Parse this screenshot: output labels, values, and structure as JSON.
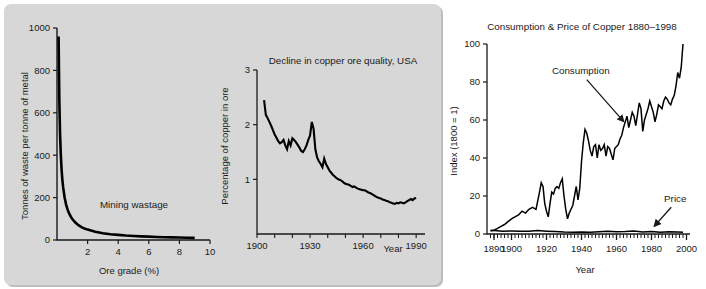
{
  "figure": {
    "panel_background": "#d7d7d7",
    "page_background": "#ffffff",
    "ink_color": "#1a1a1a"
  },
  "chart_data": [
    {
      "id": "mining-wastage",
      "type": "line",
      "title": "Mining wastage",
      "title_position": "inside-plot",
      "xlabel": "Ore grade (%)",
      "ylabel": "Tonnes of waste per tonne of metal",
      "xlim": [
        0,
        10
      ],
      "ylim": [
        0,
        1000
      ],
      "xticks": [
        0,
        2,
        4,
        6,
        8,
        10
      ],
      "xticklabels": [
        "0",
        "2",
        "4",
        "6",
        "8",
        "10"
      ],
      "yticks": [
        0,
        200,
        400,
        600,
        800,
        1000
      ],
      "yticklabels": [
        "0",
        "200",
        "400",
        "600",
        "800",
        "1000"
      ],
      "grid": false,
      "legend": "none",
      "series": [
        {
          "name": "waste per tonne of metal",
          "note": "hyperbolic: waste = 100/grade - 1",
          "x": [
            0.104,
            0.15,
            0.2,
            0.25,
            0.3,
            0.35,
            0.4,
            0.5,
            0.6,
            0.7,
            0.8,
            0.9,
            1.0,
            1.2,
            1.4,
            1.6,
            1.8,
            2.0,
            2.5,
            3.0,
            3.5,
            4.0,
            4.5,
            5.0,
            5.5,
            6.0,
            6.5,
            7.0,
            7.5,
            8.0,
            8.5,
            9.0
          ],
          "y": [
            960,
            666,
            499,
            399,
            332,
            285,
            249,
            199,
            166,
            142,
            124,
            110,
            99,
            82,
            70,
            61,
            54,
            49,
            39,
            32,
            27,
            24,
            21,
            19,
            17,
            15.7,
            14.4,
            13.3,
            12.3,
            11.5,
            10.8,
            10.1
          ]
        }
      ]
    },
    {
      "id": "copper-ore-quality",
      "type": "line",
      "title": "Decline in copper ore quality, USA",
      "title_position": "inside-plot-top-right",
      "xlabel": "Year",
      "ylabel": "Percentage of copper in ore",
      "xlim": [
        1900,
        1995
      ],
      "ylim": [
        0,
        3
      ],
      "xticks": [
        1900,
        1910,
        1920,
        1930,
        1940,
        1950,
        1960,
        1970,
        1980,
        1990
      ],
      "xticklabels": [
        "1900",
        "",
        "",
        "1930",
        "",
        "",
        "1960",
        "",
        "",
        "1990"
      ],
      "yticks": [
        0,
        1,
        2,
        3
      ],
      "yticklabels": [
        "",
        "1",
        "2",
        "3"
      ],
      "grid": false,
      "legend": "none",
      "series": [
        {
          "name": "Percentage of copper in ore",
          "x": [
            1904,
            1905,
            1906,
            1907,
            1908,
            1909,
            1910,
            1911,
            1912,
            1913,
            1914,
            1915,
            1916,
            1917,
            1918,
            1919,
            1920,
            1921,
            1922,
            1923,
            1924,
            1925,
            1926,
            1927,
            1928,
            1929,
            1930,
            1931,
            1932,
            1933,
            1934,
            1935,
            1936,
            1937,
            1938,
            1939,
            1940,
            1941,
            1942,
            1943,
            1944,
            1945,
            1946,
            1947,
            1948,
            1949,
            1950,
            1951,
            1952,
            1953,
            1954,
            1955,
            1956,
            1957,
            1958,
            1959,
            1960,
            1961,
            1962,
            1963,
            1964,
            1965,
            1966,
            1967,
            1968,
            1969,
            1970,
            1971,
            1972,
            1973,
            1974,
            1975,
            1976,
            1977,
            1978,
            1979,
            1980,
            1981,
            1982,
            1983,
            1984,
            1985,
            1986,
            1987,
            1988,
            1989,
            1990
          ],
          "y": [
            2.45,
            2.18,
            2.12,
            2.05,
            1.98,
            1.9,
            1.82,
            1.76,
            1.7,
            1.66,
            1.68,
            1.72,
            1.62,
            1.55,
            1.7,
            1.62,
            1.75,
            1.72,
            1.68,
            1.63,
            1.58,
            1.52,
            1.5,
            1.55,
            1.62,
            1.72,
            1.8,
            2.05,
            1.92,
            1.55,
            1.4,
            1.33,
            1.28,
            1.22,
            1.38,
            1.28,
            1.22,
            1.16,
            1.12,
            1.08,
            1.05,
            1.02,
            1.0,
            0.99,
            0.97,
            0.94,
            0.92,
            0.91,
            0.9,
            0.88,
            0.86,
            0.87,
            0.85,
            0.83,
            0.82,
            0.81,
            0.8,
            0.8,
            0.78,
            0.76,
            0.75,
            0.73,
            0.71,
            0.69,
            0.67,
            0.66,
            0.65,
            0.63,
            0.62,
            0.61,
            0.6,
            0.58,
            0.57,
            0.56,
            0.55,
            0.57,
            0.56,
            0.58,
            0.57,
            0.56,
            0.58,
            0.6,
            0.62,
            0.64,
            0.62,
            0.65,
            0.66
          ]
        }
      ]
    },
    {
      "id": "consumption-price-copper",
      "type": "line",
      "title": "Consumption & Price of Copper 1880–1998",
      "title_position": "above-plot",
      "xlabel": "Year",
      "ylabel": "Index (1800 = 1)",
      "xlim": [
        1886,
        2002
      ],
      "ylim": [
        0,
        100
      ],
      "xticks": [
        1890,
        1900,
        1920,
        1940,
        1960,
        1980,
        2000
      ],
      "xticklabels": [
        "1890",
        "1900",
        "1920",
        "1940",
        "1960",
        "1980",
        "2000"
      ],
      "yticks": [
        0,
        20,
        40,
        60,
        80,
        100
      ],
      "yticklabels": [
        "0",
        "20",
        "40",
        "60",
        "80",
        "100"
      ],
      "grid": false,
      "legend": "annotations",
      "annotations": [
        {
          "label": "Consumption",
          "target_x": 1967,
          "target_y": 56
        },
        {
          "label": "Price",
          "target_x": 1981,
          "target_y": 2
        }
      ],
      "series": [
        {
          "name": "Consumption",
          "x": [
            1888,
            1890,
            1892,
            1894,
            1896,
            1898,
            1900,
            1902,
            1904,
            1906,
            1908,
            1910,
            1912,
            1914,
            1916,
            1917,
            1918,
            1919,
            1920,
            1921,
            1922,
            1923,
            1924,
            1925,
            1926,
            1927,
            1928,
            1929,
            1930,
            1931,
            1932,
            1933,
            1934,
            1935,
            1936,
            1937,
            1938,
            1939,
            1940,
            1941,
            1942,
            1943,
            1944,
            1945,
            1946,
            1947,
            1948,
            1949,
            1950,
            1951,
            1952,
            1953,
            1954,
            1955,
            1956,
            1957,
            1958,
            1959,
            1960,
            1961,
            1962,
            1963,
            1964,
            1965,
            1966,
            1967,
            1968,
            1969,
            1970,
            1971,
            1972,
            1973,
            1974,
            1975,
            1976,
            1977,
            1978,
            1979,
            1980,
            1981,
            1982,
            1983,
            1984,
            1985,
            1986,
            1987,
            1988,
            1989,
            1990,
            1991,
            1992,
            1993,
            1994,
            1995,
            1996,
            1997,
            1998
          ],
          "y": [
            1.5,
            2,
            3,
            4,
            5,
            6.5,
            8,
            9,
            10,
            12,
            11,
            13,
            14,
            13,
            22,
            27,
            25,
            16,
            12,
            9,
            16,
            22,
            21,
            24,
            25,
            24,
            27,
            29,
            20,
            13,
            8,
            11,
            13,
            15,
            20,
            25,
            18,
            24,
            38,
            48,
            55,
            53,
            49,
            44,
            41,
            46,
            47,
            40,
            47,
            44,
            45,
            47,
            41,
            46,
            45,
            42,
            39,
            45,
            46,
            47,
            50,
            52,
            56,
            59,
            62,
            56,
            60,
            64,
            62,
            57,
            63,
            69,
            66,
            54,
            60,
            63,
            66,
            70,
            67,
            64,
            59,
            63,
            68,
            67,
            66,
            70,
            72,
            71,
            69,
            68,
            71,
            73,
            78,
            85,
            82,
            88,
            100
          ]
        },
        {
          "name": "Price",
          "x": [
            1888,
            1890,
            1895,
            1900,
            1905,
            1910,
            1915,
            1920,
            1925,
            1930,
            1935,
            1940,
            1945,
            1950,
            1955,
            1960,
            1965,
            1970,
            1975,
            1980,
            1985,
            1990,
            1995,
            1998
          ],
          "y": [
            2.0,
            1.8,
            1.5,
            1.6,
            1.5,
            1.4,
            1.8,
            1.5,
            1.3,
            1.0,
            0.9,
            1.0,
            0.9,
            1.2,
            1.5,
            1.2,
            1.3,
            1.6,
            1.1,
            1.3,
            0.9,
            1.2,
            1.1,
            0.9
          ]
        }
      ]
    }
  ]
}
